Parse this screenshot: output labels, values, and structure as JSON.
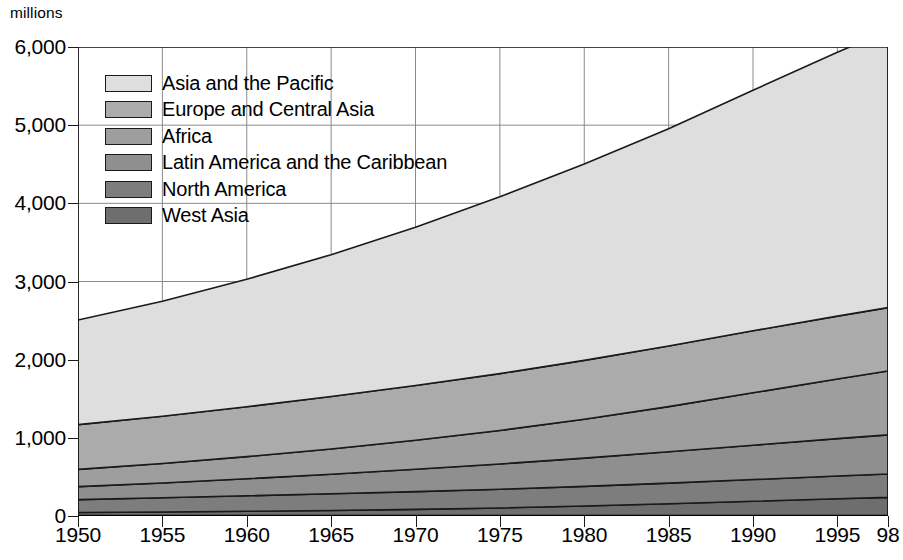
{
  "chart_data": {
    "type": "area",
    "stacked": true,
    "title": "",
    "subtitle": "",
    "xlabel": "",
    "ylabel": "millions",
    "xlim": [
      1950,
      1998
    ],
    "ylim": [
      0,
      6000
    ],
    "grid": true,
    "legend_position": "upper-left-inside",
    "x": [
      1950,
      1955,
      1960,
      1965,
      1970,
      1975,
      1980,
      1985,
      1990,
      1995,
      1998
    ],
    "x_tick_labels": [
      "1950",
      "1955",
      "1960",
      "1965",
      "1970",
      "1975",
      "1980",
      "1985",
      "1990",
      "1995",
      "98"
    ],
    "y_tick_labels": [
      "0",
      "1,000",
      "2,000",
      "3,000",
      "4,000",
      "5,000",
      "6,000"
    ],
    "y_ticks": [
      0,
      1000,
      2000,
      3000,
      4000,
      5000,
      6000
    ],
    "series": [
      {
        "name": "West Asia",
        "color": "#6e6e6e",
        "values": [
          44,
          51,
          60,
          71,
          85,
          103,
          127,
          156,
          188,
          220,
          238
        ]
      },
      {
        "name": "North America",
        "color": "#7d7d7d",
        "values": [
          166,
          182,
          199,
          214,
          227,
          239,
          252,
          265,
          278,
          292,
          300
        ]
      },
      {
        "name": "Latin America and the Caribbean",
        "color": "#8f8f8f",
        "values": [
          166,
          190,
          218,
          250,
          286,
          324,
          362,
          400,
          440,
          478,
          500
        ]
      },
      {
        "name": "Africa",
        "color": "#9e9e9e",
        "values": [
          221,
          249,
          283,
          323,
          371,
          428,
          497,
          578,
          670,
          762,
          818
        ]
      },
      {
        "name": "Europe and Central Asia",
        "color": "#ababab",
        "values": [
          572,
          605,
          638,
          670,
          700,
          727,
          753,
          775,
          793,
          805,
          810
        ]
      },
      {
        "name": "Asia and the Pacific",
        "color": "#dedede",
        "values": [
          1338,
          1471,
          1630,
          1815,
          2025,
          2263,
          2512,
          2780,
          3078,
          3375,
          3545
        ]
      }
    ],
    "totals": [
      2507,
      2748,
      3028,
      3343,
      3694,
      4084,
      4503,
      4954,
      5447,
      5932,
      6211
    ],
    "annotations": []
  },
  "legend": {
    "items": [
      {
        "label": "Asia and the Pacific",
        "color": "#dedede"
      },
      {
        "label": "Europe and Central Asia",
        "color": "#ababab"
      },
      {
        "label": "Africa",
        "color": "#9e9e9e"
      },
      {
        "label": "Latin America and the Caribbean",
        "color": "#8f8f8f"
      },
      {
        "label": "North America",
        "color": "#7d7d7d"
      },
      {
        "label": "West Asia",
        "color": "#6e6e6e"
      }
    ]
  }
}
